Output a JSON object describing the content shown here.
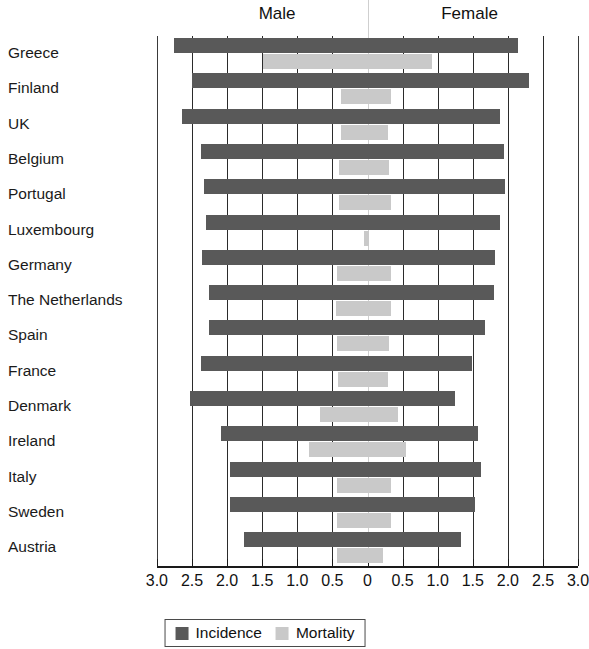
{
  "header": {
    "male_label": "Male",
    "female_label": "Female"
  },
  "legend": {
    "position": "bottom-center",
    "entries": [
      {
        "label": "Incidence",
        "color": "#595959"
      },
      {
        "label": "Mortality",
        "color": "#c9c9c9"
      }
    ]
  },
  "axis": {
    "tick_labels": [
      "3.0",
      "2.5",
      "2.0",
      "1.5",
      "1.0",
      "0.5",
      "0",
      "0.5",
      "1.0",
      "1.5",
      "2.0",
      "2.5",
      "3.0"
    ],
    "tick_values": [
      -3.0,
      -2.5,
      -2.0,
      -1.5,
      -1.0,
      -0.5,
      0,
      0.5,
      1.0,
      1.5,
      2.0,
      2.5,
      3.0
    ],
    "min": -3.0,
    "max": 3.0
  },
  "chart_data": {
    "type": "bar",
    "orientation": "horizontal",
    "layout": "population-pyramid",
    "title": "",
    "subtitle": "",
    "xlabel": "",
    "ylabel": "",
    "xlim": [
      -3.0,
      3.0
    ],
    "grid": true,
    "legend_position": "bottom-center",
    "left_group": "Male",
    "right_group": "Female",
    "categories": [
      "Greece",
      "Finland",
      "UK",
      "Belgium",
      "Portugal",
      "Luxembourg",
      "Germany",
      "The Netherlands",
      "Spain",
      "France",
      "Denmark",
      "Ireland",
      "Italy",
      "Sweden",
      "Austria"
    ],
    "series": [
      {
        "name": "Incidence",
        "color": "#595959",
        "male": [
          2.76,
          2.5,
          2.64,
          2.37,
          2.33,
          2.3,
          2.36,
          2.26,
          2.26,
          2.37,
          2.53,
          2.09,
          1.96,
          1.96,
          1.76
        ],
        "female": [
          2.14,
          2.3,
          1.89,
          1.94,
          1.96,
          1.89,
          1.82,
          1.8,
          1.67,
          1.49,
          1.25,
          1.57,
          1.62,
          1.53,
          1.33
        ]
      },
      {
        "name": "Mortality",
        "color": "#c9c9c9",
        "male": [
          1.49,
          0.38,
          0.38,
          0.4,
          0.4,
          0.05,
          0.44,
          0.45,
          0.44,
          0.42,
          0.68,
          0.83,
          0.44,
          0.44,
          0.44
        ],
        "female": [
          0.92,
          0.34,
          0.29,
          0.31,
          0.34,
          0.02,
          0.33,
          0.34,
          0.31,
          0.29,
          0.44,
          0.55,
          0.34,
          0.33,
          0.22
        ]
      }
    ]
  }
}
